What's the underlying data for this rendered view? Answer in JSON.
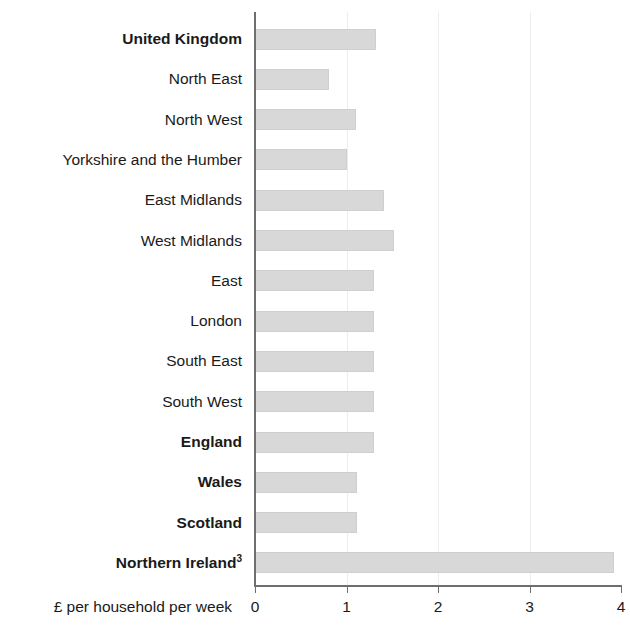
{
  "chart_data": {
    "type": "bar",
    "orientation": "horizontal",
    "title": "",
    "subtitle": "",
    "xlabel": "£ per household per week",
    "ylabel": "",
    "xlim": [
      0,
      4
    ],
    "xticks": [
      0,
      1,
      2,
      3,
      4
    ],
    "xtick_labels": [
      "0",
      "1",
      "2",
      "3",
      "4"
    ],
    "grid": true,
    "gridlines_at": [
      1,
      2,
      3
    ],
    "legend": false,
    "legend_position": "none",
    "bar_color": "#d8d8d8",
    "bar_edge_color": "#cfcfcf",
    "axis_color": "#6e6e6e",
    "gridline_color": "#ededed",
    "text_color": "#1a1a1a",
    "categories": [
      "United Kingdom",
      "North East",
      "North West",
      "Yorkshire and the Humber",
      "East Midlands",
      "West Midlands",
      "East",
      "London",
      "South East",
      "South West",
      "England",
      "Wales",
      "Scotland",
      "Northern Ireland"
    ],
    "category_labels": [
      {
        "text": "United Kingdom",
        "bold": true,
        "footnote": ""
      },
      {
        "text": "North East",
        "bold": false,
        "footnote": ""
      },
      {
        "text": "North West",
        "bold": false,
        "footnote": ""
      },
      {
        "text": "Yorkshire and the Humber",
        "bold": false,
        "footnote": ""
      },
      {
        "text": "East Midlands",
        "bold": false,
        "footnote": ""
      },
      {
        "text": "West Midlands",
        "bold": false,
        "footnote": ""
      },
      {
        "text": "East",
        "bold": false,
        "footnote": ""
      },
      {
        "text": "London",
        "bold": false,
        "footnote": ""
      },
      {
        "text": "South East",
        "bold": false,
        "footnote": ""
      },
      {
        "text": "South West",
        "bold": false,
        "footnote": ""
      },
      {
        "text": "England",
        "bold": true,
        "footnote": ""
      },
      {
        "text": "Wales",
        "bold": true,
        "footnote": ""
      },
      {
        "text": "Scotland",
        "bold": true,
        "footnote": ""
      },
      {
        "text": "Northern Ireland",
        "bold": true,
        "footnote": "3"
      }
    ],
    "values": [
      1.32,
      0.81,
      1.1,
      1.0,
      1.41,
      1.52,
      1.3,
      1.3,
      1.3,
      1.3,
      1.3,
      1.11,
      1.11,
      3.92
    ]
  }
}
